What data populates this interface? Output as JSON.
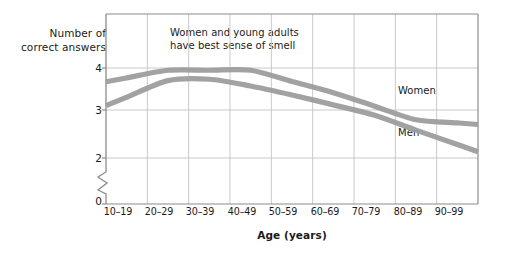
{
  "chart_data": {
    "type": "line",
    "title": "",
    "subtitle": "",
    "xlabel": "Age (years)",
    "ylabel": "Number of\ncorrect answers",
    "categories": [
      "10–19",
      "20–29",
      "30–39",
      "40–49",
      "50–59",
      "60–69",
      "70–79",
      "80–89",
      "90–99"
    ],
    "ytick_labels": [
      "0",
      "2",
      "3",
      "4"
    ],
    "ytick_values": [
      0,
      2,
      3,
      4
    ],
    "ylim": [
      2.0,
      4.3
    ],
    "y_axis_break": true,
    "y_axis_break_note": "zig-zag break between 0 and 2",
    "grid": true,
    "grid_x": true,
    "grid_y": true,
    "legend_position": "inline-right",
    "series": [
      {
        "name": "Women",
        "color": "#9a9a9a",
        "values": [
          3.78,
          3.95,
          3.95,
          3.95,
          3.7,
          3.45,
          3.15,
          2.85,
          2.78
        ]
      },
      {
        "name": "Men",
        "color": "#9a9a9a",
        "values": [
          3.35,
          3.72,
          3.75,
          3.6,
          3.4,
          3.18,
          2.95,
          2.62,
          2.3
        ]
      }
    ],
    "annotations": [
      {
        "text": "Women and young adults\nhave best sense of smell",
        "x_category": "30–39",
        "y": 4.2
      }
    ],
    "colors": {
      "line": "#9a9a9a",
      "grid": "#c9c9c9",
      "axis": "#8c8c8c",
      "text": "#1a1a1a",
      "background": "#ffffff"
    }
  }
}
